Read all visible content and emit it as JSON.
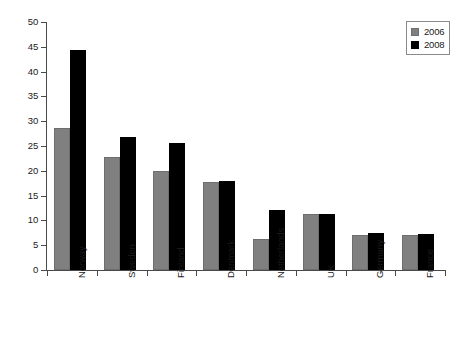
{
  "chart_data": {
    "type": "bar",
    "title": "",
    "xlabel": "",
    "ylabel": "",
    "ylim": [
      0,
      50
    ],
    "ytick_step": 5,
    "yticks": [
      "0",
      "5",
      "10",
      "15",
      "20",
      "25",
      "30",
      "35",
      "40",
      "45",
      "50"
    ],
    "grid": false,
    "legend_position": "top-right",
    "categories": [
      "Norway",
      "Sweden",
      "Finland",
      "Denmark",
      "Netherlands",
      "UK",
      "Germany",
      "France"
    ],
    "series": [
      {
        "name": "2006",
        "color": "#808080",
        "values": [
          28.7,
          22.8,
          19.9,
          17.8,
          6.3,
          11.2,
          7.1,
          7.0
        ]
      },
      {
        "name": "2008",
        "color": "#000000",
        "values": [
          44.3,
          26.8,
          25.6,
          18.0,
          12.2,
          11.3,
          7.5,
          7.3
        ]
      }
    ]
  },
  "legend": {
    "items": [
      {
        "label": "2006",
        "swatch": "legend-swatch-2006"
      },
      {
        "label": "2008",
        "swatch": "legend-swatch-2008"
      }
    ]
  }
}
